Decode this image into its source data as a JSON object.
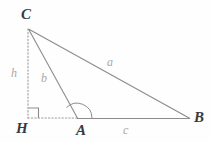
{
  "figure": {
    "background_color": "#fefefe",
    "stroke_color": "#8c8c8c",
    "label_color": "#3a3a3a",
    "side_label_color": "#a8a8a8"
  },
  "vertices": {
    "C": {
      "label": "C",
      "x": 28,
      "y": 28
    },
    "H": {
      "label": "H",
      "x": 28,
      "y": 118
    },
    "A": {
      "label": "A",
      "x": 77,
      "y": 118
    },
    "B": {
      "label": "B",
      "x": 190,
      "y": 118
    }
  },
  "sides": {
    "a": {
      "label": "a",
      "from": "C",
      "to": "B",
      "style": "solid"
    },
    "b": {
      "label": "b",
      "from": "C",
      "to": "A",
      "style": "solid"
    },
    "c": {
      "label": "c",
      "from": "A",
      "to": "B",
      "style": "solid"
    },
    "h": {
      "label": "h",
      "from": "C",
      "to": "H",
      "style": "dotted"
    },
    "base_extension": {
      "label": "",
      "from": "H",
      "to": "A",
      "style": "dotted"
    }
  },
  "marks": {
    "right_angle_at_H": {
      "name": "right-angle-mark",
      "size": 10
    },
    "angle_at_A": {
      "name": "angle-arc",
      "radius": 11
    }
  }
}
